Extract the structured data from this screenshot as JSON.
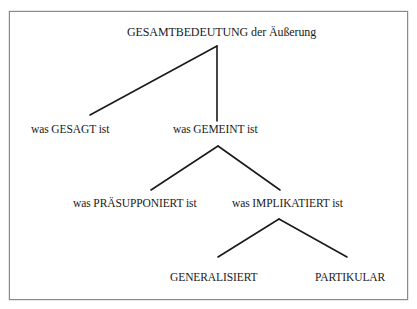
{
  "diagram": {
    "type": "tree",
    "colors": {
      "line": "#1a1a1a",
      "text": "#1a1a1a",
      "border": "#8a8a8a",
      "background": "#ffffff"
    },
    "nodes": {
      "root": {
        "label": "GESAMTBEDEUTUNG der Äußerung"
      },
      "said": {
        "label": "was GESAGT ist"
      },
      "meant": {
        "label": "was GEMEINT ist"
      },
      "presupposed": {
        "label": "was PRÄSUPPONIERT ist"
      },
      "implicated": {
        "label": "was IMPLIKATIERT ist"
      },
      "generalized": {
        "label": "GENERALISIERT"
      },
      "particular": {
        "label": "PARTIKULAR"
      }
    },
    "edges": [
      {
        "from": "root",
        "to": "said"
      },
      {
        "from": "root",
        "to": "meant"
      },
      {
        "from": "meant",
        "to": "presupposed"
      },
      {
        "from": "meant",
        "to": "implicated"
      },
      {
        "from": "implicated",
        "to": "generalized"
      },
      {
        "from": "implicated",
        "to": "particular"
      }
    ]
  }
}
